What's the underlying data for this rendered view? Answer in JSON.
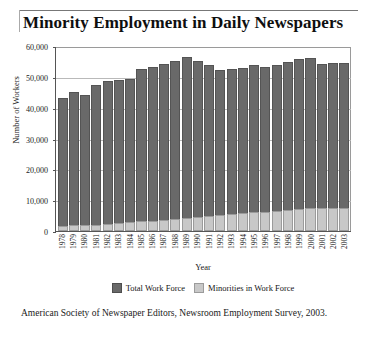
{
  "chart_data": {
    "type": "bar",
    "title": "Minority Employment in Daily Newspapers",
    "xlabel": "Year",
    "ylabel": "Number of Workers",
    "ylim": [
      0,
      60000
    ],
    "yticks": [
      0,
      10000,
      20000,
      30000,
      40000,
      50000,
      60000
    ],
    "ytick_labels": [
      "0",
      "10,000",
      "20,000",
      "30,000",
      "40,000",
      "50,000",
      "60,000"
    ],
    "grid": true,
    "legend_position": "bottom",
    "categories": [
      "1978",
      "1979",
      "1980",
      "1981",
      "1982",
      "1983",
      "1984",
      "1985",
      "1986",
      "1987",
      "1988",
      "1989",
      "1990",
      "1991",
      "1992",
      "1993",
      "1994",
      "1995",
      "1996",
      "1997",
      "1998",
      "1999",
      "2000",
      "2001",
      "2002",
      "2003"
    ],
    "series": [
      {
        "name": "Total Work Force",
        "color": "#696969",
        "values": [
          43000,
          45000,
          44000,
          47200,
          48800,
          49000,
          49200,
          52700,
          53200,
          54200,
          55200,
          56400,
          55000,
          54000,
          52300,
          52400,
          52800,
          54000,
          53100,
          54000,
          54700,
          55800,
          56000,
          54200,
          54400,
          54500
        ]
      },
      {
        "name": "Minorities in Work Force",
        "color": "#c8c8c8",
        "values": [
          1700,
          1800,
          1900,
          2100,
          2300,
          2600,
          2900,
          3100,
          3400,
          3600,
          3900,
          4200,
          4500,
          4900,
          5200,
          5500,
          5700,
          6100,
          6300,
          6600,
          6800,
          7000,
          7400,
          7500,
          7500,
          7600
        ]
      }
    ]
  },
  "caption": {
    "text": "American Society of Newspaper Editors, Newsroom Employment Survey, 2003."
  }
}
